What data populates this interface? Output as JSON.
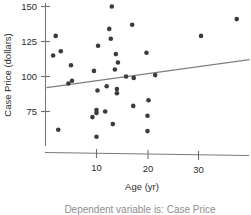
{
  "chart_data": {
    "type": "scatter",
    "title": "",
    "xlabel": "Age (yr)",
    "ylabel": "Case Price (dollars)",
    "xlim": [
      0,
      40
    ],
    "ylim": [
      55,
      152
    ],
    "grid": false,
    "legend": null,
    "xticks": [
      10,
      20,
      30
    ],
    "yticks": [
      75,
      100,
      125,
      150
    ],
    "points": [
      {
        "x": 13.0,
        "y": 150
      },
      {
        "x": 17.0,
        "y": 137
      },
      {
        "x": 37.5,
        "y": 141
      },
      {
        "x": 12.5,
        "y": 134
      },
      {
        "x": 2.0,
        "y": 129
      },
      {
        "x": 30.5,
        "y": 129
      },
      {
        "x": 12.8,
        "y": 127
      },
      {
        "x": 10.3,
        "y": 122
      },
      {
        "x": 1.5,
        "y": 115
      },
      {
        "x": 3.0,
        "y": 118
      },
      {
        "x": 13.8,
        "y": 116
      },
      {
        "x": 19.8,
        "y": 117
      },
      {
        "x": 14.2,
        "y": 110
      },
      {
        "x": 5.0,
        "y": 108
      },
      {
        "x": 9.5,
        "y": 104
      },
      {
        "x": 13.6,
        "y": 105
      },
      {
        "x": 15.8,
        "y": 100
      },
      {
        "x": 17.3,
        "y": 99
      },
      {
        "x": 21.5,
        "y": 101
      },
      {
        "x": 4.5,
        "y": 95
      },
      {
        "x": 5.2,
        "y": 97
      },
      {
        "x": 12.0,
        "y": 93
      },
      {
        "x": 10.2,
        "y": 90
      },
      {
        "x": 14.0,
        "y": 91
      },
      {
        "x": 14.0,
        "y": 88
      },
      {
        "x": 17.2,
        "y": 79
      },
      {
        "x": 20.2,
        "y": 83
      },
      {
        "x": 10.0,
        "y": 76
      },
      {
        "x": 10.0,
        "y": 74
      },
      {
        "x": 11.7,
        "y": 75
      },
      {
        "x": 9.2,
        "y": 71
      },
      {
        "x": 20.0,
        "y": 72
      },
      {
        "x": 13.2,
        "y": 66
      },
      {
        "x": 2.5,
        "y": 62
      },
      {
        "x": 20.0,
        "y": 61
      },
      {
        "x": 10.0,
        "y": 57
      }
    ],
    "fit_line": {
      "x_start": 0.2,
      "y_start": 92,
      "x_end": 40,
      "y_end": 112
    }
  },
  "caption": {
    "text": "Dependent variable is: Case Price"
  }
}
